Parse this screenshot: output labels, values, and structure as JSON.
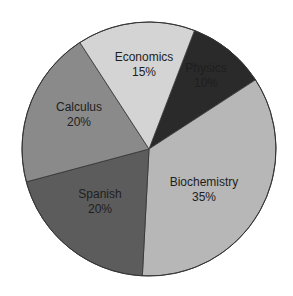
{
  "chart_data": {
    "type": "pie",
    "title": "",
    "start_angle_deg": 21,
    "direction": "clockwise",
    "center": [
      149,
      149
    ],
    "radius": 127,
    "slices": [
      {
        "label": "Physics",
        "value": 10,
        "display": "10%",
        "color": "#2a2a2a",
        "label_pos": [
          206,
          72
        ]
      },
      {
        "label": "Biochemistry",
        "value": 35,
        "display": "35%",
        "color": "#b7b7b7",
        "label_pos": [
          204,
          186
        ]
      },
      {
        "label": "Spanish",
        "value": 20,
        "display": "20%",
        "color": "#5c5c5c",
        "label_pos": [
          100,
          198
        ]
      },
      {
        "label": "Calculus",
        "value": 20,
        "display": "20%",
        "color": "#8a8a8a",
        "label_pos": [
          79,
          111
        ]
      },
      {
        "label": "Economics",
        "value": 15,
        "display": "15%",
        "color": "#d4d4d4",
        "label_pos": [
          144,
          61
        ]
      }
    ],
    "categories": [
      "Physics",
      "Biochemistry",
      "Spanish",
      "Calculus",
      "Economics"
    ],
    "values": [
      10,
      35,
      20,
      20,
      15
    ],
    "legend": "none",
    "edge_color": "#333333"
  }
}
